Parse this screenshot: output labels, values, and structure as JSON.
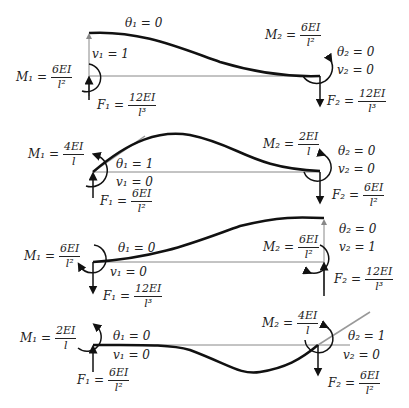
{
  "colors": {
    "beam": "#111111",
    "axis": "#888888",
    "tangent": "#999999",
    "text": "#222222"
  },
  "cases": [
    {
      "id": "v1",
      "theta1": "θ₁ = 0",
      "v1": "v₁ = 1",
      "theta2": "θ₂ = 0",
      "v2": "v₂ = 0",
      "M1": {
        "lhs": "M₁ =",
        "num": "6EI",
        "den": "l²"
      },
      "F1": {
        "lhs": "F₁ =",
        "num": "12EI",
        "den": "l³"
      },
      "M2": {
        "lhs": "M₂ =",
        "num": "6EI",
        "den": "l²"
      },
      "F2": {
        "lhs": "F₂ =",
        "num": "12EI",
        "den": "l³"
      }
    },
    {
      "id": "theta1",
      "theta1": "θ₁ = 1",
      "v1": "v₁ = 0",
      "theta2": "θ₂ = 0",
      "v2": "v₂ = 0",
      "M1": {
        "lhs": "M₁ =",
        "num": "4EI",
        "den": "l"
      },
      "F1": {
        "lhs": "F₁ =",
        "num": "6EI",
        "den": "l²"
      },
      "M2": {
        "lhs": "M₂ =",
        "num": "2EI",
        "den": "l"
      },
      "F2": {
        "lhs": "F₂ =",
        "num": "6EI",
        "den": "l²"
      }
    },
    {
      "id": "v2",
      "theta1": "θ₁ = 0",
      "v1": "v₁ = 0",
      "theta2": "θ₂ = 0",
      "v2": "v₂ = 1",
      "M1": {
        "lhs": "M₁ =",
        "num": "6EI",
        "den": "l²"
      },
      "F1": {
        "lhs": "F₁ =",
        "num": "12EI",
        "den": "l³"
      },
      "M2": {
        "lhs": "M₂ =",
        "num": "6EI",
        "den": "l²"
      },
      "F2": {
        "lhs": "F₂ =",
        "num": "12EI",
        "den": "l³"
      }
    },
    {
      "id": "theta2",
      "theta1": "θ₁ = 0",
      "v1": "v₁ = 0",
      "theta2": "θ₂ = 1",
      "v2": "v₂ = 0",
      "M1": {
        "lhs": "M₁ =",
        "num": "2EI",
        "den": "l"
      },
      "F1": {
        "lhs": "F₁ =",
        "num": "6EI",
        "den": "l²"
      },
      "M2": {
        "lhs": "M₂ =",
        "num": "4EI",
        "den": "l"
      },
      "F2": {
        "lhs": "F₂ =",
        "num": "6EI",
        "den": "l²"
      }
    }
  ]
}
